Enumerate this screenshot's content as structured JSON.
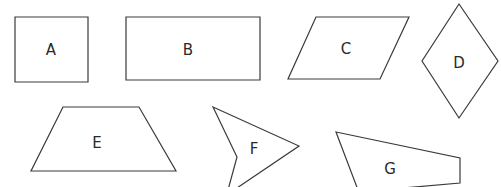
{
  "diagram": {
    "stroke_color": "#3a3a3a",
    "label_color": "#2a2a2a",
    "shapes": [
      {
        "id": "A",
        "label": "A",
        "kind": "square",
        "points": "15,17 88,17 88,82 15,82",
        "label_pos": [
          51,
          50
        ]
      },
      {
        "id": "B",
        "label": "B",
        "kind": "rectangle",
        "points": "126,17 260,17 260,80 126,80",
        "label_pos": [
          188,
          50
        ]
      },
      {
        "id": "C",
        "label": "C",
        "kind": "parallelogram",
        "points": "316,17 409,17 380,79 288,79",
        "label_pos": [
          346,
          49
        ]
      },
      {
        "id": "D",
        "label": "D",
        "kind": "rhombus",
        "points": "459,4 498,61 459,118 422,61",
        "label_pos": [
          459,
          63
        ]
      },
      {
        "id": "E",
        "label": "E",
        "kind": "trapezoid",
        "points": "63,107 139,107 176,171 31,171",
        "label_pos": [
          97,
          143
        ]
      },
      {
        "id": "F",
        "label": "F",
        "kind": "concave-quadrilateral",
        "points": "213,107 299,146 234,190 228,190 237,157",
        "label_pos": [
          254,
          149
        ]
      },
      {
        "id": "G",
        "label": "G",
        "kind": "irregular-quadrilateral",
        "points": "336,132 460,158 460,183 380,190 358,190",
        "label_pos": [
          390,
          169
        ]
      }
    ]
  }
}
